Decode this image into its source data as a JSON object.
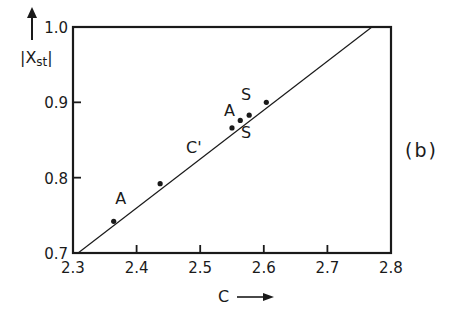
{
  "chart_data": {
    "type": "scatter",
    "title": "",
    "panel_label": "(b)",
    "xlabel": "C",
    "ylabel": "|X_st|",
    "ylabel_main": "|X",
    "ylabel_sub": "st",
    "ylabel_end": "|",
    "xlim": [
      2.3,
      2.8
    ],
    "ylim": [
      0.7,
      1.0
    ],
    "xticks": [
      2.3,
      2.4,
      2.5,
      2.6,
      2.7,
      2.8
    ],
    "xtick_labels": [
      "2.3",
      "2.4",
      "2.5",
      "2.6",
      "2.7",
      "2.8"
    ],
    "yticks": [
      0.7,
      0.8,
      0.9,
      1.0
    ],
    "ytick_labels": [
      "0.7",
      "0.8",
      "0.9",
      "1.0"
    ],
    "grid": false,
    "fit_line": {
      "x": [
        2.308,
        2.77
      ],
      "y": [
        0.7,
        1.0
      ]
    },
    "points": [
      {
        "x": 2.364,
        "y": 0.742
      },
      {
        "x": 2.437,
        "y": 0.792
      },
      {
        "x": 2.55,
        "y": 0.866
      },
      {
        "x": 2.563,
        "y": 0.876
      },
      {
        "x": 2.577,
        "y": 0.883
      },
      {
        "x": 2.604,
        "y": 0.9
      }
    ],
    "annotations": [
      {
        "text": "A",
        "x": 2.375,
        "y": 0.765
      },
      {
        "text": "C'",
        "x": 2.49,
        "y": 0.833
      },
      {
        "text": "A",
        "x": 2.546,
        "y": 0.882
      },
      {
        "text": "S",
        "x": 2.572,
        "y": 0.903
      },
      {
        "text": "S",
        "x": 2.572,
        "y": 0.852
      }
    ],
    "colors": {
      "line": "#1a1a1a",
      "points": "#1a1a1a",
      "background": "#ffffff"
    }
  }
}
